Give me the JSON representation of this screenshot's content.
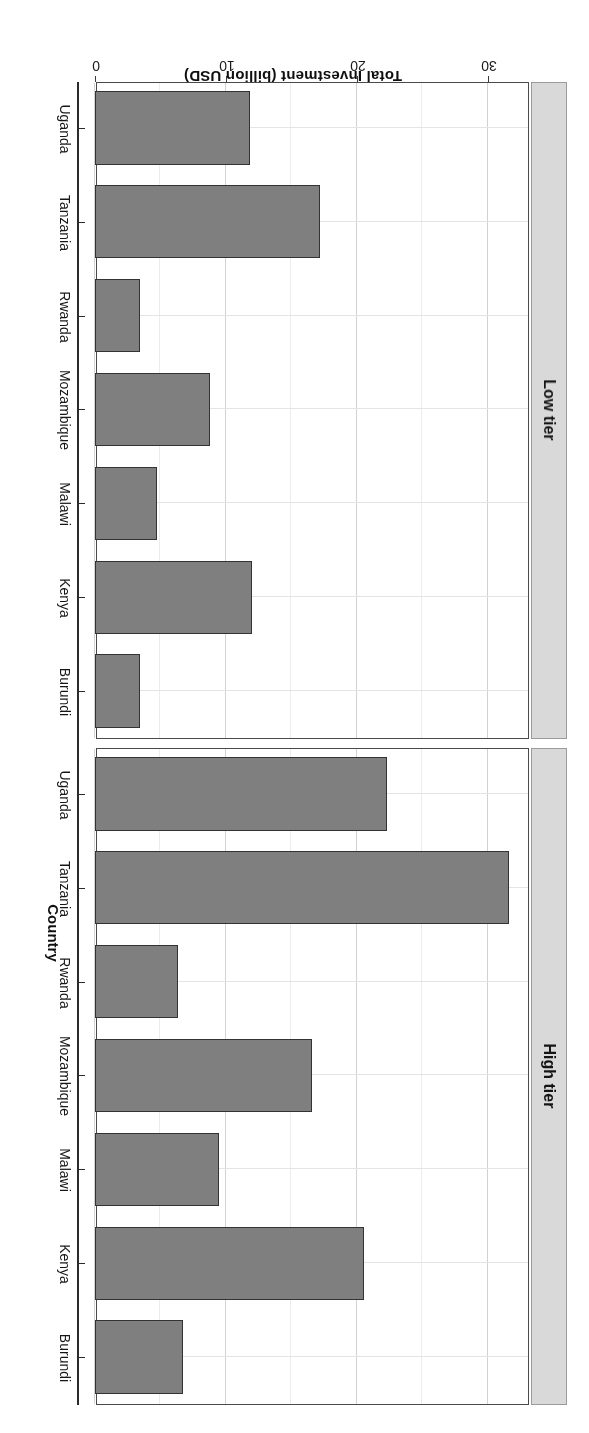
{
  "chart_data": {
    "type": "bar",
    "orientation": "horizontal",
    "title": "",
    "xlabel": "Country",
    "ylabel": "Total Investment (billion USD)",
    "categories": [
      "Burundi",
      "Kenya",
      "Malawi",
      "Mozambique",
      "Rwanda",
      "Tanzania",
      "Uganda"
    ],
    "facet_labels": [
      "Low tier",
      "High tier"
    ],
    "facets": [
      {
        "label": "Low tier",
        "categories": [
          "Burundi",
          "Kenya",
          "Malawi",
          "Mozambique",
          "Rwanda",
          "Tanzania",
          "Uganda"
        ],
        "values": [
          3.4,
          12.0,
          4.7,
          8.8,
          3.4,
          17.2,
          11.8
        ]
      },
      {
        "label": "High tier",
        "categories": [
          "Burundi",
          "Kenya",
          "Malawi",
          "Mozambique",
          "Rwanda",
          "Tanzania",
          "Uganda"
        ],
        "values": [
          6.7,
          20.5,
          9.5,
          16.6,
          6.3,
          31.6,
          22.3
        ]
      }
    ],
    "value_ticks": [
      0,
      10,
      20,
      30
    ],
    "value_tick_labels": [
      "0",
      "10",
      "20",
      "30"
    ],
    "ylim": [
      0,
      33
    ],
    "grid": true,
    "legend": "none",
    "bar_fill": "#7f7f7f",
    "bar_stroke": "#333333",
    "strip_fill": "#d9d9d9",
    "panel_background": "#ffffff",
    "rotated_180": true
  },
  "axes": {
    "value_axis_title": "Total Investment (billion USD)",
    "category_axis_title": "Country"
  },
  "strips": {
    "high": "High tier",
    "low": "Low tier"
  }
}
